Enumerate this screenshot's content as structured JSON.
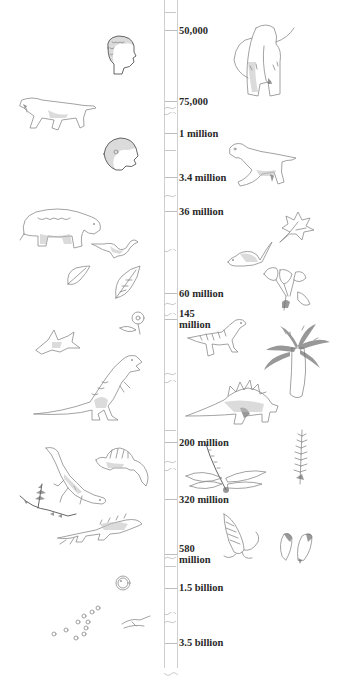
{
  "timeline": {
    "markers": [
      {
        "label": "50,000",
        "y": 24
      },
      {
        "label": "75,000",
        "y": 96
      },
      {
        "label": "1 million",
        "y": 128
      },
      {
        "label": "3.4 million",
        "y": 172
      },
      {
        "label": "36 million",
        "y": 206
      },
      {
        "label": "60 million",
        "y": 288
      },
      {
        "label": "145",
        "label2": "million",
        "y": 308
      },
      {
        "label": "200 million",
        "y": 437
      },
      {
        "label": "320 million",
        "y": 494
      },
      {
        "label": "580",
        "label2": "million",
        "y": 543
      },
      {
        "label": "1.5 billion",
        "y": 582
      },
      {
        "label": "3.5 billion",
        "y": 637
      }
    ]
  },
  "illustrations": [
    {
      "name": "modern-human-head",
      "side": "left"
    },
    {
      "name": "woolly-mammoth",
      "side": "right"
    },
    {
      "name": "sabertooth-cat",
      "side": "left"
    },
    {
      "name": "early-hominid-head",
      "side": "left"
    },
    {
      "name": "early-horse",
      "side": "right"
    },
    {
      "name": "bear-like-mammal",
      "side": "left"
    },
    {
      "name": "small-bird",
      "side": "left"
    },
    {
      "name": "maple-leaf",
      "side": "right"
    },
    {
      "name": "rodent-mammal",
      "side": "right"
    },
    {
      "name": "leaf-fossils",
      "side": "left"
    },
    {
      "name": "ginkgo-plant",
      "side": "right"
    },
    {
      "name": "flower",
      "side": "left"
    },
    {
      "name": "pterosaur",
      "side": "left"
    },
    {
      "name": "small-theropod-dinosaur",
      "side": "right"
    },
    {
      "name": "cycad-tree",
      "side": "right"
    },
    {
      "name": "tyrannosaurus",
      "side": "left"
    },
    {
      "name": "stegosaurus",
      "side": "right"
    },
    {
      "name": "horsetail-plant",
      "side": "right"
    },
    {
      "name": "lizard-reptile",
      "side": "left"
    },
    {
      "name": "dimetrodon",
      "side": "left"
    },
    {
      "name": "dragonfly",
      "side": "right"
    },
    {
      "name": "fern-branch",
      "side": "left"
    },
    {
      "name": "early-tetrapod",
      "side": "left"
    },
    {
      "name": "trilobite-like-arthropod",
      "side": "right"
    },
    {
      "name": "sea-creatures",
      "side": "right"
    },
    {
      "name": "single-cell",
      "side": "left"
    },
    {
      "name": "bacteria-colony",
      "side": "left"
    },
    {
      "name": "early-microbes",
      "side": "left"
    }
  ]
}
